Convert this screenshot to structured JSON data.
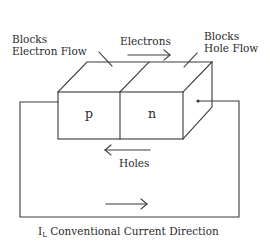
{
  "diagram": {
    "labels": {
      "blocks_electron": [
        "Blocks",
        "Electron Flow"
      ],
      "blocks_hole": [
        "Blocks",
        "Hole Flow"
      ],
      "electrons": "Electrons",
      "holes": "Holes",
      "p_region": "p",
      "n_region": "n",
      "current_symbol": "I",
      "current_subscript": "L",
      "current_caption": "Conventional Current Direction"
    },
    "colors": {
      "line": "#3a3a3a",
      "text": "#2a2a2a",
      "background": "#ffffff"
    },
    "arrows": {
      "electrons": "right",
      "holes": "left",
      "conventional_current": "right"
    }
  }
}
